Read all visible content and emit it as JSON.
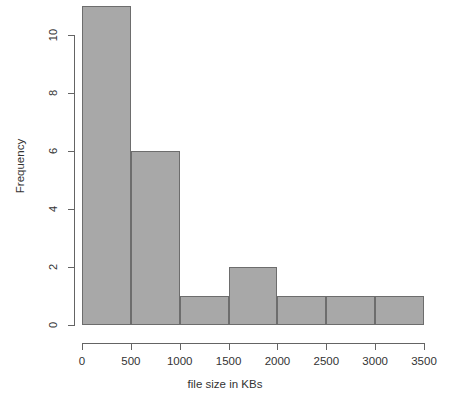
{
  "chart_data": {
    "type": "bar",
    "chart_kind": "histogram",
    "title": "",
    "subtitle": "",
    "xlabel": "file size in KBs",
    "ylabel": "Frequency",
    "categories": [
      "0-500",
      "500-1000",
      "1000-1500",
      "1500-2000",
      "2000-2500",
      "2500-3000",
      "3000-3500"
    ],
    "bin_edges": [
      0,
      500,
      1000,
      1500,
      2000,
      2500,
      3000,
      3500
    ],
    "bin_width": 500,
    "values": [
      11,
      6,
      1,
      2,
      1,
      1,
      1
    ],
    "xlim": [
      0,
      3500
    ],
    "ylim": [
      0,
      11
    ],
    "x_ticks": [
      0,
      500,
      1000,
      1500,
      2000,
      2500,
      3000,
      3500
    ],
    "x_tick_labels": [
      "0",
      "500",
      "1000",
      "1500",
      "2000",
      "2500",
      "3000",
      "3500"
    ],
    "y_ticks": [
      0,
      2,
      4,
      6,
      8,
      10
    ],
    "y_tick_labels": [
      "0",
      "2",
      "4",
      "6",
      "8",
      "10"
    ],
    "grid": false,
    "legend": null,
    "legend_position": "none",
    "annotations": [],
    "bar_fill_color": "#a8a8a8",
    "bar_border_color": "#6d6d6d",
    "axis_color": "#646464",
    "background_color": "#ffffff",
    "total_count": 23
  }
}
